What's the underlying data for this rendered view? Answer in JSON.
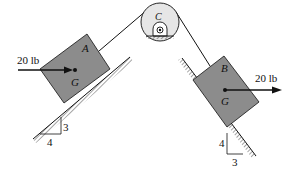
{
  "diagram": {
    "colors": {
      "block_fill": "#8c8c8c",
      "pulley_fill": "#e6e6e6",
      "line": "#111111"
    },
    "block_a": {
      "label": "A",
      "center_label": "G"
    },
    "block_b": {
      "label": "B",
      "center_label": "G"
    },
    "pulley": {
      "label": "C"
    },
    "force_a": {
      "label": "20 lb"
    },
    "force_b": {
      "label": "20 lb"
    },
    "slope_a": {
      "rise": "3",
      "run": "4"
    },
    "slope_b": {
      "rise": "4",
      "run": "3"
    }
  }
}
